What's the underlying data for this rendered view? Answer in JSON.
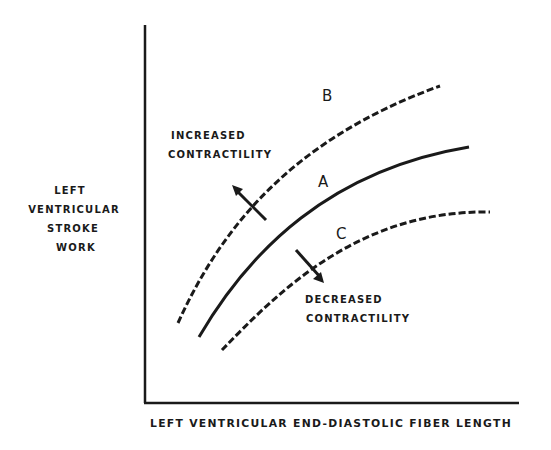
{
  "figure": {
    "y_axis_label": [
      "LEFT",
      "VENTRICULAR",
      "STROKE",
      "WORK"
    ],
    "x_axis_label": "LEFT VENTRICULAR END-DIASTOLIC FIBER LENGTH",
    "curves": [
      {
        "id": "B",
        "label": "B",
        "style": "dashed",
        "meaning": "increased contractility"
      },
      {
        "id": "A",
        "label": "A",
        "style": "solid",
        "meaning": "normal"
      },
      {
        "id": "C",
        "label": "C",
        "style": "dashed",
        "meaning": "decreased contractility"
      }
    ],
    "annotations": {
      "increased": [
        "INCREASED",
        "CONTRACTILITY"
      ],
      "decreased": [
        "DECREASED",
        "CONTRACTILITY"
      ]
    },
    "colors": {
      "ink": "#1a1a1a",
      "background": "#ffffff"
    }
  }
}
